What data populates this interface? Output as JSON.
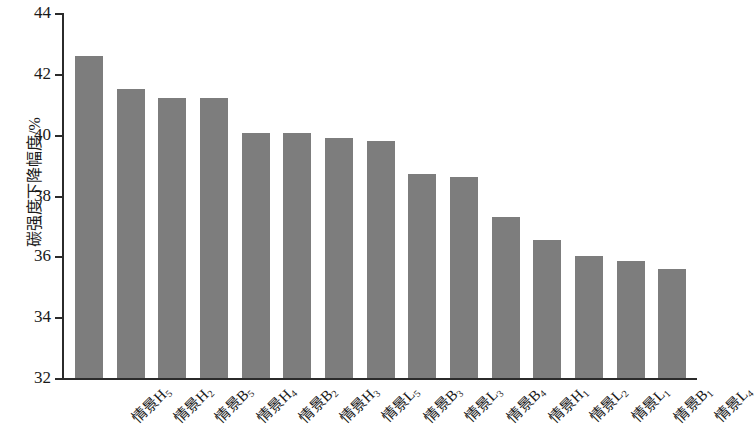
{
  "chart_data": {
    "type": "bar",
    "title": "",
    "xlabel": "",
    "ylabel": "碳强度下降幅度/%",
    "ylim": [
      32,
      44
    ],
    "yticks": [
      32,
      34,
      36,
      38,
      40,
      42,
      44
    ],
    "grid": false,
    "legend": "none",
    "bar_color": "#7d7d7d",
    "categories": [
      "情景H5",
      "情景H2",
      "情景B5",
      "情景H4",
      "情景B2",
      "情景H3",
      "情景L5",
      "情景B3",
      "情景L3",
      "情景B4",
      "情景H1",
      "情景L2",
      "情景L1",
      "情景B1",
      "情景L4"
    ],
    "category_parts": [
      {
        "base": "情景H",
        "sub": "5"
      },
      {
        "base": "情景H",
        "sub": "2"
      },
      {
        "base": "情景B",
        "sub": "5"
      },
      {
        "base": "情景H",
        "sub": "4"
      },
      {
        "base": "情景B",
        "sub": "2"
      },
      {
        "base": "情景H",
        "sub": "3"
      },
      {
        "base": "情景L",
        "sub": "5"
      },
      {
        "base": "情景B",
        "sub": "3"
      },
      {
        "base": "情景L",
        "sub": "3"
      },
      {
        "base": "情景B",
        "sub": "4"
      },
      {
        "base": "情景H",
        "sub": "1"
      },
      {
        "base": "情景L",
        "sub": "2"
      },
      {
        "base": "情景L",
        "sub": "1"
      },
      {
        "base": "情景B",
        "sub": "1"
      },
      {
        "base": "情景L",
        "sub": "4"
      }
    ],
    "values": [
      42.6,
      41.5,
      41.2,
      41.2,
      40.05,
      40.05,
      39.9,
      39.8,
      38.7,
      38.6,
      37.3,
      36.55,
      36.0,
      35.85,
      35.6
    ]
  }
}
